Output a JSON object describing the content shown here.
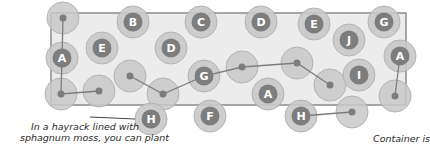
{
  "colors": {
    "container_fill": "#ececec",
    "container_stroke": "#8c8c8c",
    "outer_circle": "#c9c9c9",
    "outer_circle_stroke": "#b3b3b3",
    "inner_circle": "#7d7d7d",
    "connector": "#7d7d7d",
    "text": "#2a2a2a"
  },
  "container": {
    "x": 51,
    "y": 13,
    "width": 355,
    "height": 92
  },
  "plants": [
    {
      "label": "B",
      "x": 133,
      "y": 22
    },
    {
      "label": "C",
      "x": 201,
      "y": 22
    },
    {
      "label": "D",
      "x": 261,
      "y": 22
    },
    {
      "label": "E",
      "x": 314,
      "y": 24
    },
    {
      "label": "G",
      "x": 384,
      "y": 22
    },
    {
      "label": "J",
      "x": 349,
      "y": 40
    },
    {
      "label": "E",
      "x": 102,
      "y": 48
    },
    {
      "label": "D",
      "x": 171,
      "y": 48
    },
    {
      "label": "A",
      "x": 62,
      "y": 58
    },
    {
      "label": "G",
      "x": 204,
      "y": 76
    },
    {
      "label": "A",
      "x": 268,
      "y": 94
    },
    {
      "label": "I",
      "x": 359,
      "y": 75
    },
    {
      "label": "A",
      "x": 400,
      "y": 56
    },
    {
      "label": "H",
      "x": 151,
      "y": 119
    },
    {
      "label": "F",
      "x": 210,
      "y": 116
    },
    {
      "label": "H",
      "x": 301,
      "y": 116
    }
  ],
  "dots": [
    {
      "x": 63,
      "y": 18
    },
    {
      "x": 61,
      "y": 94
    },
    {
      "x": 99,
      "y": 91
    },
    {
      "x": 130,
      "y": 76
    },
    {
      "x": 163,
      "y": 94
    },
    {
      "x": 242,
      "y": 67
    },
    {
      "x": 297,
      "y": 63
    },
    {
      "x": 330,
      "y": 85
    },
    {
      "x": 395,
      "y": 96
    },
    {
      "x": 352,
      "y": 112
    }
  ],
  "connectors": [
    {
      "points": "63,18 62,58 61,94 99,91"
    },
    {
      "points": "130,76 163,94 204,76 242,67 297,63 330,85"
    },
    {
      "points": "400,56 395,96"
    },
    {
      "points": "301,116 352,112"
    }
  ],
  "annotations": {
    "left_caption_line1": "In a hayrack lined with",
    "left_caption_line2": "sphagnum moss, you can plant",
    "right_caption": "Container is",
    "pointer": {
      "x1": 90,
      "y1": 117,
      "x2": 135,
      "y2": 119
    }
  }
}
